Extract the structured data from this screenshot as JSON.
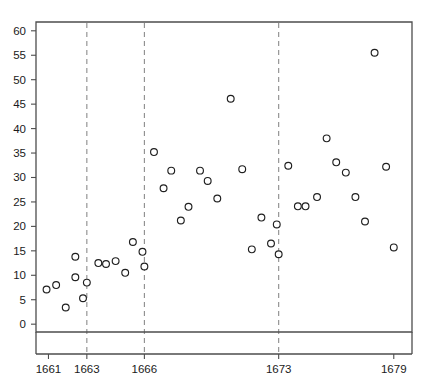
{
  "chart_data": {
    "type": "scatter",
    "title": "",
    "subtitle": "",
    "xlabel": "",
    "ylabel": "",
    "xlim": [
      1660.35,
      1679.95
    ],
    "ylim": [
      -1.6,
      61.8
    ],
    "grid": false,
    "legend": null,
    "x_ticks": [
      1661,
      1663,
      1666,
      1673,
      1679
    ],
    "x_tick_labels": [
      "1661",
      "1663",
      "1666",
      "1673",
      "1679"
    ],
    "y_ticks": [
      0,
      5,
      10,
      15,
      20,
      25,
      30,
      35,
      40,
      45,
      50,
      55,
      60
    ],
    "y_tick_labels": [
      "0",
      "5",
      "10",
      "15",
      "20",
      "25",
      "30",
      "35",
      "40",
      "45",
      "50",
      "55",
      "60"
    ],
    "annotations": [
      {
        "type": "vline",
        "x": 1663,
        "style": "dashed",
        "color": "#8c8c8c"
      },
      {
        "type": "vline",
        "x": 1666,
        "style": "dashed",
        "color": "#8c8c8c"
      },
      {
        "type": "vline",
        "x": 1673,
        "style": "dashed",
        "color": "#8c8c8c"
      }
    ],
    "marker": {
      "shape": "circle-open",
      "radius_px": 3.4,
      "edge_color": "#1f1f1f",
      "face_color": "#ffffff"
    },
    "points": [
      {
        "x": 1660.9,
        "y": 7.1
      },
      {
        "x": 1661.4,
        "y": 8.0
      },
      {
        "x": 1661.9,
        "y": 3.4
      },
      {
        "x": 1662.4,
        "y": 9.6
      },
      {
        "x": 1662.4,
        "y": 13.8
      },
      {
        "x": 1662.8,
        "y": 5.3
      },
      {
        "x": 1663.0,
        "y": 8.5
      },
      {
        "x": 1663.6,
        "y": 12.5
      },
      {
        "x": 1664.0,
        "y": 12.3
      },
      {
        "x": 1664.5,
        "y": 12.9
      },
      {
        "x": 1665.0,
        "y": 10.5
      },
      {
        "x": 1665.4,
        "y": 16.8
      },
      {
        "x": 1665.9,
        "y": 14.8
      },
      {
        "x": 1666.0,
        "y": 11.8
      },
      {
        "x": 1666.5,
        "y": 35.2
      },
      {
        "x": 1667.0,
        "y": 27.8
      },
      {
        "x": 1667.4,
        "y": 31.4
      },
      {
        "x": 1667.9,
        "y": 21.2
      },
      {
        "x": 1668.3,
        "y": 24.0
      },
      {
        "x": 1668.9,
        "y": 31.4
      },
      {
        "x": 1669.3,
        "y": 29.3
      },
      {
        "x": 1669.8,
        "y": 25.7
      },
      {
        "x": 1670.5,
        "y": 46.1
      },
      {
        "x": 1671.1,
        "y": 31.7
      },
      {
        "x": 1671.6,
        "y": 15.3
      },
      {
        "x": 1672.1,
        "y": 21.8
      },
      {
        "x": 1672.6,
        "y": 16.5
      },
      {
        "x": 1672.9,
        "y": 20.4
      },
      {
        "x": 1673.0,
        "y": 14.3
      },
      {
        "x": 1673.5,
        "y": 32.4
      },
      {
        "x": 1674.0,
        "y": 24.1
      },
      {
        "x": 1674.4,
        "y": 24.1
      },
      {
        "x": 1675.0,
        "y": 26.0
      },
      {
        "x": 1675.5,
        "y": 38.0
      },
      {
        "x": 1676.0,
        "y": 33.1
      },
      {
        "x": 1676.5,
        "y": 31.0
      },
      {
        "x": 1677.0,
        "y": 26.0
      },
      {
        "x": 1677.5,
        "y": 21.0
      },
      {
        "x": 1678.0,
        "y": 55.5
      },
      {
        "x": 1678.6,
        "y": 32.2
      },
      {
        "x": 1679.0,
        "y": 15.7
      }
    ]
  },
  "figure": {
    "background_color": "#ffffff",
    "axis_color": "#4d4d4d",
    "text_color": "#1a1a1a",
    "vline_color": "#8c8c8c"
  }
}
